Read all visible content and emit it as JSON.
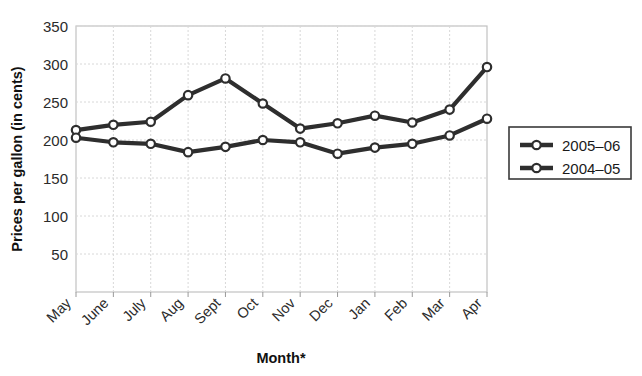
{
  "chart_data": {
    "type": "line",
    "title": "",
    "xlabel": "Month*",
    "ylabel": "Prices per gallon (in cents)",
    "categories": [
      "May",
      "June",
      "July",
      "Aug",
      "Sept",
      "Oct",
      "Nov",
      "Dec",
      "Jan",
      "Feb",
      "Mar",
      "Apr"
    ],
    "series": [
      {
        "name": "2005–06",
        "values": [
          213,
          220,
          224,
          259,
          281,
          248,
          215,
          222,
          232,
          223,
          240,
          296
        ]
      },
      {
        "name": "2004–05",
        "values": [
          203,
          197,
          195,
          184,
          191,
          200,
          197,
          182,
          190,
          195,
          206,
          228
        ]
      }
    ],
    "ylim": [
      0,
      350
    ],
    "yticks": [
      50,
      100,
      150,
      200,
      250,
      300,
      350
    ],
    "ytick_labels": [
      "50",
      "100",
      "150",
      "200",
      "250",
      "300",
      "350"
    ],
    "grid": true,
    "legend_position": "right"
  },
  "axes": {
    "y_title": "Prices per gallon (in cents)",
    "x_title": "Month*"
  },
  "legend": {
    "entries": [
      {
        "label": "2005–06"
      },
      {
        "label": "2004–05"
      }
    ]
  }
}
